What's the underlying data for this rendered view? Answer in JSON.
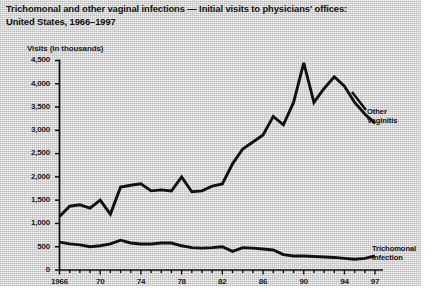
{
  "title": {
    "line1": "Trichomonal and other vaginal infections — Initial visits to physicians' offices:",
    "line2": "United States, 1966–1997"
  },
  "axis_caption": "Visits (in thousands)",
  "labels": {
    "other_vaginitis_line1": "Other",
    "other_vaginitis_line2": "Vaginitis",
    "trichomonal_line1": "Trichomonal",
    "trichomonal_line2": "Infection"
  },
  "colors": {
    "ink": "#111111",
    "paper": "#e9e9e9",
    "line": "#111111"
  },
  "chart_data": {
    "type": "line",
    "title": "Trichomonal and other vaginal infections — Initial visits to physicians' offices: United States, 1966–1997",
    "xlabel": "",
    "ylabel": "Visits (in thousands)",
    "ylim": [
      0,
      4500
    ],
    "xlim": [
      1966,
      1997
    ],
    "grid": false,
    "legend": "inline-right-annotations",
    "ytick_labels": [
      "4,500",
      "4,000",
      "3,500",
      "3,000",
      "2,500",
      "2,000",
      "1,500",
      "1,000",
      "500",
      "0"
    ],
    "ytick_values": [
      4500,
      4000,
      3500,
      3000,
      2500,
      2000,
      1500,
      1000,
      500,
      0
    ],
    "xtick_labels": [
      "1966",
      "70",
      "74",
      "78",
      "82",
      "86",
      "90",
      "94",
      "97"
    ],
    "xtick_values": [
      1966,
      1970,
      1974,
      1978,
      1982,
      1986,
      1990,
      1994,
      1997
    ],
    "x": [
      1966,
      1967,
      1968,
      1969,
      1970,
      1971,
      1972,
      1973,
      1974,
      1975,
      1976,
      1977,
      1978,
      1979,
      1980,
      1981,
      1982,
      1983,
      1984,
      1985,
      1986,
      1987,
      1988,
      1989,
      1990,
      1991,
      1992,
      1993,
      1994,
      1995,
      1996,
      1997
    ],
    "series": [
      {
        "name": "Other Vaginitis",
        "values": [
          1150,
          1370,
          1400,
          1330,
          1500,
          1200,
          1780,
          1820,
          1850,
          1700,
          1720,
          1700,
          2000,
          1680,
          1700,
          1800,
          1850,
          2280,
          2600,
          2750,
          2900,
          3300,
          3120,
          3600,
          4450,
          3600,
          3900,
          4150,
          3950,
          3600,
          3350,
          3150
        ]
      },
      {
        "name": "Trichomonal Infection",
        "values": [
          600,
          560,
          540,
          500,
          520,
          560,
          640,
          580,
          560,
          560,
          580,
          580,
          520,
          480,
          470,
          480,
          500,
          400,
          480,
          470,
          450,
          430,
          330,
          300,
          300,
          290,
          280,
          270,
          250,
          230,
          250,
          300
        ]
      }
    ]
  }
}
